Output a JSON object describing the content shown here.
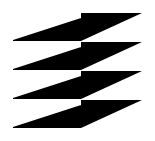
{
  "image": {
    "kind": "logo-mark",
    "title": "Abstract chevron logo",
    "width": 155,
    "height": 141,
    "background_color": "#ffffff",
    "mark_color": "#000000",
    "description": "Black geometric mark of four stacked rows; each row has a left block with a white wedge cut and a right triangle tapering toward the lower left"
  },
  "geometry": {
    "left_column": {
      "x_start": 13,
      "x_end": 81,
      "rows": [
        {
          "name": "row-1",
          "top": 13,
          "bottom": 41,
          "wedge_left_y": 40,
          "wedge_right_y": 18
        },
        {
          "name": "row-2",
          "top": 42,
          "bottom": 70,
          "wedge_left_y": 69,
          "wedge_right_y": 47
        },
        {
          "name": "row-3",
          "top": 71,
          "bottom": 99,
          "wedge_left_y": 98,
          "wedge_right_y": 76
        },
        {
          "name": "row-4",
          "top": 100,
          "bottom": 128,
          "wedge_left_y": 127,
          "wedge_right_y": 105
        }
      ]
    },
    "right_column": {
      "x_start": 81,
      "x_end": 142,
      "rows": [
        {
          "name": "row-1",
          "top": 13,
          "apex_y": 41
        },
        {
          "name": "row-2",
          "top": 42,
          "apex_y": 70
        },
        {
          "name": "row-3",
          "top": 71,
          "apex_y": 99
        },
        {
          "name": "row-4",
          "top": 100,
          "apex_y": 128
        }
      ]
    }
  }
}
